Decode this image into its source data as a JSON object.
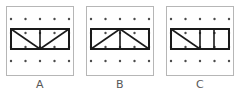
{
  "figure": {
    "title": "",
    "panel_count": 3,
    "grid": {
      "columns": 5,
      "rows": 4,
      "dot_color": "#4a4a4a",
      "board_border_color": "#b6b6b6",
      "background_color": "#ffffff"
    },
    "shape_color": "#1a1a1a",
    "label_color": "#585858"
  },
  "panels": [
    {
      "label": "A",
      "shape_name": "rectangle-with-v-diagonals",
      "description": "Wide rectangle spanning the full dot row width with a vertical line at the center and two diagonals meeting at the bottom center",
      "outline_points": "4,22 62,22 62,42 4,42",
      "inner_lines": [
        "33,22 33,42",
        "4,22 33,42",
        "33,42 62,22"
      ]
    },
    {
      "label": "B",
      "shape_name": "rectangle-with-lambda-diagonals",
      "description": "Wide rectangle spanning the full dot row width with a vertical line at the center and two diagonals meeting at the top center",
      "outline_points": "4,22 62,22 62,42 4,42",
      "inner_lines": [
        "33,22 33,42",
        "4,42 33,22",
        "33,22 62,42"
      ]
    },
    {
      "label": "C",
      "shape_name": "rectangle-three-cells-one-diagonal",
      "description": "Wide rectangle divided into three cells by two vertical lines, with a single diagonal from top left to bottom right in the left cell",
      "outline_points": "4,22 62,22 62,42 4,42",
      "inner_lines": [
        "33,22 33,42",
        "47,22 47,42",
        "4,22 33,42"
      ]
    }
  ],
  "dot_positions": {
    "x": [
      4,
      18.5,
      33,
      47.5,
      62
    ],
    "y": [
      12,
      26,
      40,
      54
    ]
  }
}
